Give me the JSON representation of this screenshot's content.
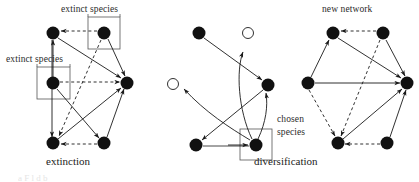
{
  "figure": {
    "title_visible": false,
    "background_color": "#ffffff",
    "ink_color": "#1a1a1a",
    "panels": [
      {
        "id": "extinction",
        "caption": "extinction",
        "caption_x": 47,
        "caption_y": 158,
        "labels": [
          {
            "name": "extinct-species-top",
            "text": "extinct species",
            "x": 61,
            "y": 6
          },
          {
            "name": "extinct-species-left",
            "text": "extinct species",
            "x": 6,
            "y": 56
          }
        ],
        "boxes": [
          {
            "name": "extinct-box-top",
            "x": 88,
            "y": 17,
            "w": 32,
            "h": 32
          },
          {
            "name": "extinct-box-left",
            "x": 37,
            "y": 67,
            "w": 33,
            "h": 32
          }
        ],
        "nodes": [
          {
            "name": "node-top-left",
            "x": 53,
            "y": 33,
            "r": 6.5,
            "filled": true
          },
          {
            "name": "node-top-right-extinct",
            "x": 104,
            "y": 33,
            "r": 6.5,
            "filled": true
          },
          {
            "name": "node-left-extinct",
            "x": 53,
            "y": 83,
            "r": 6.5,
            "filled": true
          },
          {
            "name": "node-right",
            "x": 127,
            "y": 83,
            "r": 6.5,
            "filled": true
          },
          {
            "name": "node-bottom-left",
            "x": 53,
            "y": 143,
            "r": 6.5,
            "filled": true
          },
          {
            "name": "node-bottom-right",
            "x": 104,
            "y": 143,
            "r": 6.5,
            "filled": true
          }
        ]
      },
      {
        "id": "diversification",
        "caption": "diversification",
        "caption_x": 265,
        "caption_y": 158,
        "labels": [
          {
            "name": "chosen-species-line1",
            "text": "chosen",
            "x": 278,
            "y": 120
          },
          {
            "name": "chosen-species-line2",
            "text": "species",
            "x": 278,
            "y": 132
          }
        ],
        "boxes": [
          {
            "name": "chosen-box",
            "x": 240,
            "y": 129,
            "w": 32,
            "h": 31
          }
        ],
        "nodes": [
          {
            "name": "node-top-left",
            "x": 199,
            "y": 33,
            "r": 6.5,
            "filled": true
          },
          {
            "name": "node-top-right-empty",
            "x": 248,
            "y": 33,
            "r": 5.5,
            "filled": false
          },
          {
            "name": "node-left-empty",
            "x": 173,
            "y": 84,
            "r": 5.5,
            "filled": false
          },
          {
            "name": "node-right",
            "x": 268,
            "y": 85,
            "r": 6.5,
            "filled": true
          },
          {
            "name": "node-bottom-left",
            "x": 196,
            "y": 145,
            "r": 6.5,
            "filled": true
          },
          {
            "name": "node-chosen",
            "x": 256,
            "y": 145,
            "r": 6.5,
            "filled": true
          }
        ]
      },
      {
        "id": "new-network",
        "caption": "",
        "labels": [
          {
            "name": "new-network-label",
            "text": "new network",
            "x": 325,
            "y": 6
          }
        ],
        "boxes": [],
        "nodes": [
          {
            "name": "node-top-left",
            "x": 333,
            "y": 33,
            "r": 6.5,
            "filled": true
          },
          {
            "name": "node-top-right",
            "x": 383,
            "y": 33,
            "r": 6.5,
            "filled": true
          },
          {
            "name": "node-left",
            "x": 308,
            "y": 83,
            "r": 6.5,
            "filled": true
          },
          {
            "name": "node-right",
            "x": 407,
            "y": 83,
            "r": 6.5,
            "filled": true
          },
          {
            "name": "node-bottom-left",
            "x": 338,
            "y": 143,
            "r": 6.5,
            "filled": true
          },
          {
            "name": "node-bottom-right",
            "x": 387,
            "y": 143,
            "r": 6.5,
            "filled": true
          }
        ]
      }
    ],
    "edge_styles": {
      "solid": "solid line with arrowhead",
      "dashed": "dashed line with arrowhead",
      "curved": "curved solid line with arrowhead"
    },
    "footer_caption_partial": "a  F         l        d  b"
  }
}
